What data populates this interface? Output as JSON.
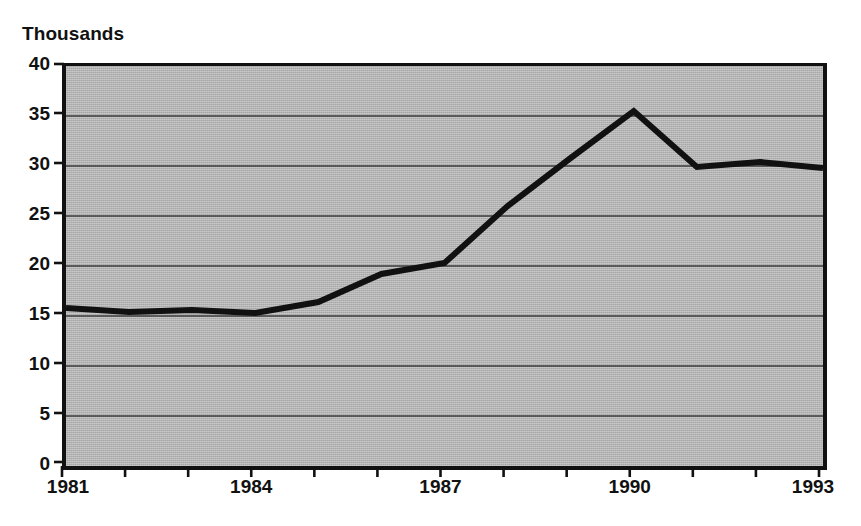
{
  "chart_data": {
    "type": "line",
    "title": "Thousands",
    "xlabel": "",
    "ylabel": "",
    "x": [
      1981,
      1982,
      1983,
      1984,
      1985,
      1986,
      1987,
      1988,
      1989,
      1990,
      1991,
      1992,
      1993
    ],
    "values": [
      15.8,
      15.4,
      15.6,
      15.3,
      16.4,
      19.2,
      20.3,
      26.0,
      30.8,
      35.5,
      29.9,
      30.4,
      29.8
    ],
    "series": [
      {
        "name": "Thousands",
        "values": [
          15.8,
          15.4,
          15.6,
          15.3,
          16.4,
          19.2,
          20.3,
          26.0,
          30.8,
          35.5,
          29.9,
          30.4,
          29.8
        ]
      }
    ],
    "xlim": [
      1981,
      1993
    ],
    "ylim": [
      0,
      40
    ],
    "y_ticks": [
      0,
      5,
      10,
      15,
      20,
      25,
      30,
      35,
      40
    ],
    "y_tick_labels": [
      "0",
      "5",
      "10",
      "15",
      "20",
      "25",
      "30",
      "35",
      "40"
    ],
    "x_ticks": [
      1981,
      1982,
      1983,
      1984,
      1985,
      1986,
      1987,
      1988,
      1989,
      1990,
      1991,
      1992,
      1993
    ],
    "x_tick_labels_shown": [
      "1981",
      "1984",
      "1987",
      "1990",
      "1993"
    ],
    "x_tick_label_positions": [
      1981,
      1984,
      1987,
      1990,
      1993
    ],
    "grid": "horizontal",
    "legend": "none",
    "plot_background_color": "#b4b4b4",
    "line_color": "#111111",
    "gridline_color": "#3b3b3b",
    "axis_color": "#111111",
    "line_width_px": 6,
    "annotations": []
  }
}
